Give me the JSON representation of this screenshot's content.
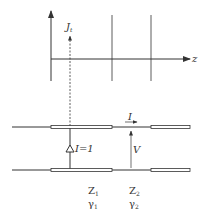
{
  "diagram": {
    "axis": {
      "horizontal_label": "z"
    },
    "source_label": {
      "main": "J",
      "subscript": "t"
    },
    "current_source": {
      "label": "I=1"
    },
    "line_current": {
      "label": "I"
    },
    "voltage": {
      "label": "V"
    },
    "sections": [
      {
        "impedance_main": "Z",
        "impedance_sub": "1",
        "propagation_main": "γ",
        "propagation_sub": "1"
      },
      {
        "impedance_main": "Z",
        "impedance_sub": "2",
        "propagation_main": "γ",
        "propagation_sub": "2"
      }
    ],
    "colors": {
      "line": "#333333",
      "background": "#ffffff"
    }
  }
}
